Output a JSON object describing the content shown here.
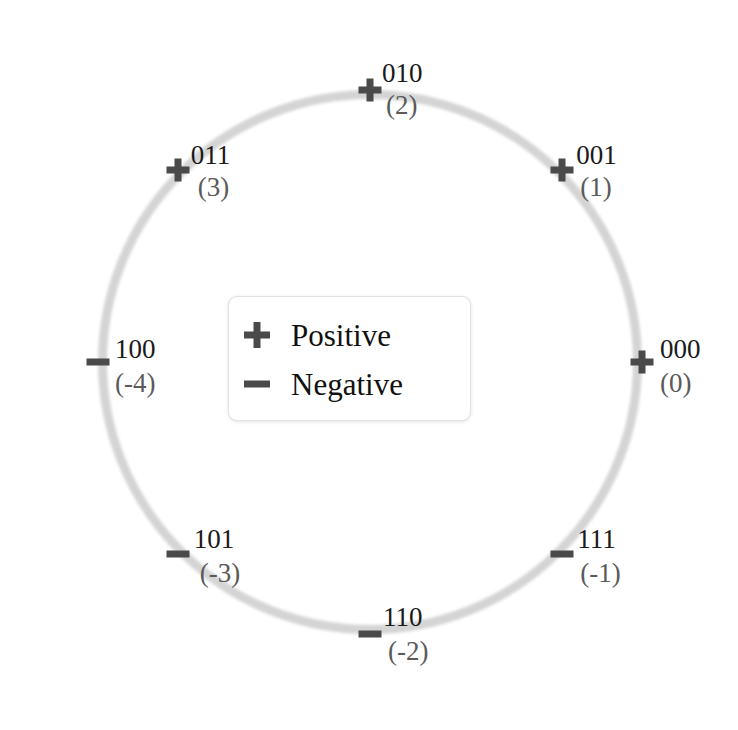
{
  "figure": {
    "type": "circle-diagram",
    "circle": {
      "center_x": 370,
      "center_y": 362,
      "radius": 272,
      "ring_color": "#d2d2d2",
      "ring_width": 9
    },
    "colors": {
      "marker": "#4a4a4a",
      "bits_text": "#1a1a1a",
      "value_text": "#5a5a5a",
      "background": "#ffffff",
      "legend_border": "#e2e2e2"
    }
  },
  "nodes": [
    {
      "bits": "000",
      "value": "(0)",
      "sign": "positive",
      "marker": "plus-marker",
      "angle_deg": 0,
      "label_dx": 18,
      "label_dy": -26,
      "value_dx": 18,
      "value_dy": 8
    },
    {
      "bits": "001",
      "value": "(1)",
      "sign": "positive",
      "marker": "plus-marker",
      "angle_deg": 45,
      "label_dx": 14,
      "label_dy": -28,
      "value_dx": 18,
      "value_dy": 4
    },
    {
      "bits": "010",
      "value": "(2)",
      "sign": "positive",
      "marker": "plus-marker",
      "angle_deg": 90,
      "label_dx": 12,
      "label_dy": -30,
      "value_dx": 16,
      "value_dy": 2
    },
    {
      "bits": "011",
      "value": "(3)",
      "sign": "positive",
      "marker": "plus-marker",
      "angle_deg": 135,
      "label_dx": 13,
      "label_dy": -28,
      "value_dx": 20,
      "value_dy": 4
    },
    {
      "bits": "100",
      "value": "(-4)",
      "sign": "negative",
      "marker": "minus-marker",
      "angle_deg": 180,
      "label_dx": 17,
      "label_dy": -26,
      "value_dx": 17,
      "value_dy": 8
    },
    {
      "bits": "101",
      "value": "(-3)",
      "sign": "negative",
      "marker": "minus-marker",
      "angle_deg": 225,
      "label_dx": 16,
      "label_dy": -28,
      "value_dx": 22,
      "value_dy": 6
    },
    {
      "bits": "110",
      "value": "(-2)",
      "sign": "negative",
      "marker": "minus-marker",
      "angle_deg": 270,
      "label_dx": 13,
      "label_dy": -30,
      "value_dx": 18,
      "value_dy": 4
    },
    {
      "bits": "111",
      "value": "(-1)",
      "sign": "negative",
      "marker": "minus-marker",
      "angle_deg": 315,
      "label_dx": 15,
      "label_dy": -28,
      "value_dx": 18,
      "value_dy": 6
    }
  ],
  "legend": {
    "positive_label": "Positive",
    "negative_label": "Negative"
  }
}
